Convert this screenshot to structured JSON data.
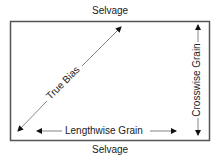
{
  "diagram": {
    "top_label": "Selvage",
    "bottom_label": "Selvage",
    "diagonal_label": "True Bias",
    "horizontal_label": "Lengthwise Grain",
    "vertical_label": "Crosswise Grain",
    "line_color": "#555555",
    "text_color": "#222222"
  }
}
